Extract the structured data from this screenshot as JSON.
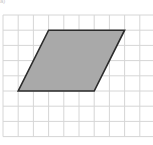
{
  "figure": {
    "label": "a)",
    "grid": {
      "origin_x": 3,
      "origin_y": 15,
      "cell_size": 15.2,
      "columns": 10,
      "rows": 8,
      "line_color": "#d6d6d6"
    },
    "shape": {
      "type": "parallelogram",
      "vertices_grid_units": [
        [
          3,
          1
        ],
        [
          8,
          1
        ],
        [
          6,
          5
        ],
        [
          1,
          5
        ]
      ],
      "fill": "#a9a9a9",
      "stroke": "#2b2b2b",
      "base_units": 5,
      "height_units": 4
    }
  }
}
